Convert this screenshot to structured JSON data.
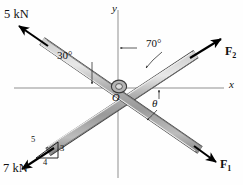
{
  "figure": {
    "background": "#ffffff",
    "bar_fill": "#a9a9a9",
    "bar_highlight": "#d8d8d8",
    "bar_outline": "#3a3a3a",
    "axis_color": "#8a8a8a",
    "arrow_color": "#000000"
  },
  "axes": {
    "x_label": "x",
    "y_label": "y",
    "origin_label": "O"
  },
  "forces": [
    {
      "id": "force-5kn",
      "label": "5 kN",
      "direction": "up-left",
      "angle_label": "30°",
      "angle_value": 30,
      "angle_reference": "negative x-axis",
      "magnitude": 5,
      "unit": "kN"
    },
    {
      "id": "force-f2",
      "label": "F",
      "subscript": "2",
      "direction": "up-right",
      "angle_label": "70°",
      "angle_value": 70,
      "angle_reference": "positive y-axis"
    },
    {
      "id": "force-f1",
      "label": "F",
      "subscript": "1",
      "direction": "down-right",
      "angle_label": "θ",
      "angle_reference": "positive x-axis"
    },
    {
      "id": "force-7kn",
      "label": "7 kN",
      "direction": "down-left",
      "magnitude": 7,
      "unit": "kN",
      "slope_triangle": {
        "hypotenuse": "5",
        "vertical": "3",
        "horizontal": "4"
      }
    }
  ]
}
